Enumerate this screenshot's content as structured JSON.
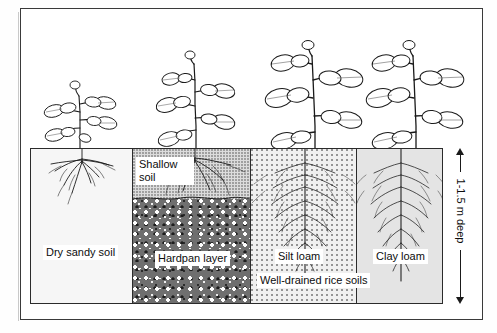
{
  "figure": {
    "title": "",
    "frame_color": "#3a3a3a"
  },
  "soil_panels": [
    {
      "id": "dry-sandy",
      "label": "Dry sandy soil",
      "texture": "fine-dotted-light",
      "root_depth": "shallow",
      "plant_size": "small"
    },
    {
      "id": "shallow-hardpan",
      "label_top": "Shallow soil",
      "label_bottom": "Hardpan layer",
      "texture_top": "medium-dotted",
      "texture_bottom": "coarse-pebble-dark",
      "root_depth": "very-shallow",
      "plant_size": "small-medium"
    },
    {
      "id": "silt-loam",
      "label": "Silt loam",
      "texture": "speckled",
      "root_depth": "deep",
      "plant_size": "large"
    },
    {
      "id": "clay-loam",
      "label": "Clay loam",
      "texture": "uniform-gray-speckle",
      "root_depth": "deep",
      "plant_size": "large"
    }
  ],
  "group_label": "Well-drained rice soils",
  "dimension": {
    "label": "1-1.5 m deep",
    "arrow": "double-headed-vertical"
  },
  "colors": {
    "ink": "#1a1a1a",
    "frame": "#3a3a3a",
    "sand": "#f6f6f6",
    "shallow": "#dcdcdc",
    "hardpan": "#6f6f6f",
    "silt": "#f0f0f0",
    "clay": "#e4e4e4"
  },
  "icons": {
    "plant": "plant-icon",
    "root": "root-system-icon",
    "arrow": "dimension-arrow-icon"
  }
}
